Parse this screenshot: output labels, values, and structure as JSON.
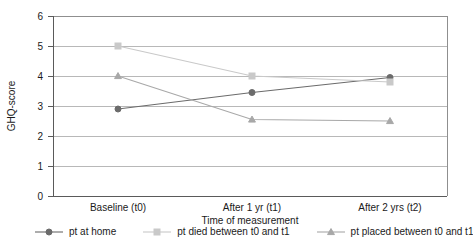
{
  "chart_data": {
    "type": "line",
    "title": "",
    "xlabel": "Time of measurement",
    "ylabel": "GHQ-score",
    "categories": [
      "Baseline (t0)",
      "After 1 yr (t1)",
      "After 2 yrs (t2)"
    ],
    "ylim": [
      0,
      6
    ],
    "yticks": [
      0,
      1,
      2,
      3,
      4,
      5,
      6
    ],
    "grid": true,
    "legend_position": "bottom",
    "series": [
      {
        "name": "pt at home",
        "values": [
          2.9,
          3.45,
          3.95
        ],
        "color": "#6b6b6b",
        "marker": "circle"
      },
      {
        "name": "pt died between t0 and t1",
        "values": [
          5.0,
          4.0,
          3.8
        ],
        "color": "#c9c9c9",
        "marker": "square"
      },
      {
        "name": "pt placed between t0 and t1",
        "values": [
          4.0,
          2.55,
          2.5
        ],
        "color": "#a8a8a8",
        "marker": "triangle"
      }
    ]
  },
  "axes": {
    "y_title": "GHQ-score",
    "x_title": "Time of measurement",
    "y_tick_labels": [
      "0",
      "1",
      "2",
      "3",
      "4",
      "5",
      "6"
    ],
    "x_tick_labels": [
      "Baseline (t0)",
      "After 1 yr (t1)",
      "After 2 yrs (t2)"
    ]
  },
  "legend": {
    "items": [
      {
        "label": "pt at home",
        "color": "#6b6b6b",
        "marker": "circle"
      },
      {
        "label": "pt died between t0 and t1",
        "color": "#c9c9c9",
        "marker": "square"
      },
      {
        "label": "pt placed between t0 and t1",
        "color": "#a8a8a8",
        "marker": "triangle"
      }
    ]
  }
}
